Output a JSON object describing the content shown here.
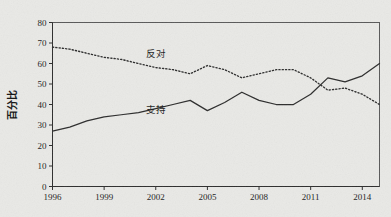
{
  "chart_data": {
    "type": "line",
    "title": "",
    "subtitle": "",
    "xlabel": "",
    "ylabel": "百分比",
    "xlim": [
      1996,
      2015
    ],
    "ylim": [
      0,
      80
    ],
    "grid": false,
    "legend_position": "inline-annotation",
    "y_ticks": [
      0,
      10,
      20,
      30,
      40,
      50,
      60,
      70,
      80
    ],
    "y_tick_labels": [
      "0",
      "10",
      "20",
      "30",
      "40",
      "50",
      "60",
      "70",
      "80"
    ],
    "x_ticks": [
      1996,
      1999,
      2002,
      2005,
      2008,
      2011,
      2014
    ],
    "x_tick_labels": [
      "1996",
      "1999",
      "2002",
      "2005",
      "2008",
      "2011",
      "2014"
    ],
    "x": [
      1996,
      1997,
      1998,
      1999,
      2000,
      2001,
      2002,
      2003,
      2004,
      2005,
      2006,
      2007,
      2008,
      2009,
      2010,
      2011,
      2012,
      2013,
      2014,
      2015
    ],
    "series": [
      {
        "name": "支持",
        "style": "solid",
        "color": "#2b2b2b",
        "label_x": 2002,
        "label_y": 36,
        "values": [
          27,
          29,
          32,
          34,
          35,
          36,
          38,
          40,
          42,
          37,
          41,
          46,
          42,
          40,
          40,
          45,
          53,
          51,
          54,
          60
        ]
      },
      {
        "name": "反对",
        "style": "dotted",
        "color": "#2b2b2b",
        "label_x": 2002,
        "label_y": 63,
        "values": [
          68,
          67,
          65,
          63,
          62,
          60,
          58,
          57,
          55,
          59,
          57,
          53,
          55,
          57,
          57,
          53,
          47,
          48,
          45,
          40
        ]
      }
    ],
    "annotations": [
      {
        "text": "反对",
        "x": 2002,
        "y": 63
      },
      {
        "text": "支持",
        "x": 2002,
        "y": 36
      }
    ],
    "colors": {
      "background": "#e9e9e6",
      "axis": "#2c2c2c",
      "frame": "#585858",
      "text": "#1c1c1c",
      "line": "#2b2b2b"
    }
  }
}
